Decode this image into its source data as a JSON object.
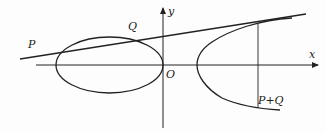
{
  "diagram": {
    "labels": {
      "y_axis": "y",
      "x_axis": "x",
      "origin": "O",
      "point_p": "P",
      "point_q": "Q",
      "sum": "P+Q"
    },
    "colors": {
      "stroke": "#222222",
      "background": "#fdfdfd"
    }
  }
}
